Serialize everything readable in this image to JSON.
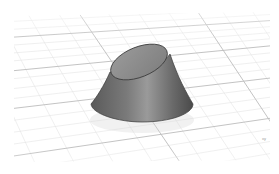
{
  "viewport": {
    "view_name": "Perspective",
    "background_color": "#ffffff",
    "grid": {
      "minor_line_color": "#e6e6e6",
      "major_line_color": "#bdbdbd",
      "visible": true
    },
    "object": {
      "type": "truncated-cone",
      "top_face": "oblique-elliptical-cut",
      "body_color": "#6e6e6e",
      "top_color": "#8c8c8c",
      "edge_color": "#333333"
    },
    "axis_label": "xy"
  }
}
